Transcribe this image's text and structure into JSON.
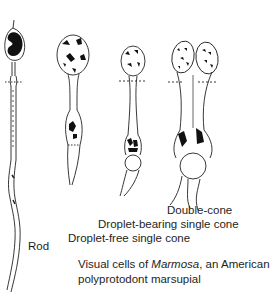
{
  "figure": {
    "labels": {
      "rod": "Rod",
      "droplet_free": "Droplet-free single cone",
      "droplet_bearing": "Droplet-bearing single cone",
      "double_cone": "Double-cone"
    },
    "caption": {
      "line1_prefix": "Visual cells of ",
      "line1_genus": "Marmosa",
      "line1_suffix": ", an American",
      "line2": "polyprotodont marsupial"
    },
    "cells": [
      {
        "name": "rod",
        "description": "long thin rod with dark nucleus at top"
      },
      {
        "name": "droplet-free single cone",
        "description": "cone with blotched nucleus, no oil droplet"
      },
      {
        "name": "droplet-bearing single cone",
        "description": "cone with oil droplet below ellipsoid"
      },
      {
        "name": "double-cone",
        "description": "paired cone with two nuclei and large oil droplet"
      }
    ],
    "ink_color": "#1a1a1a"
  }
}
